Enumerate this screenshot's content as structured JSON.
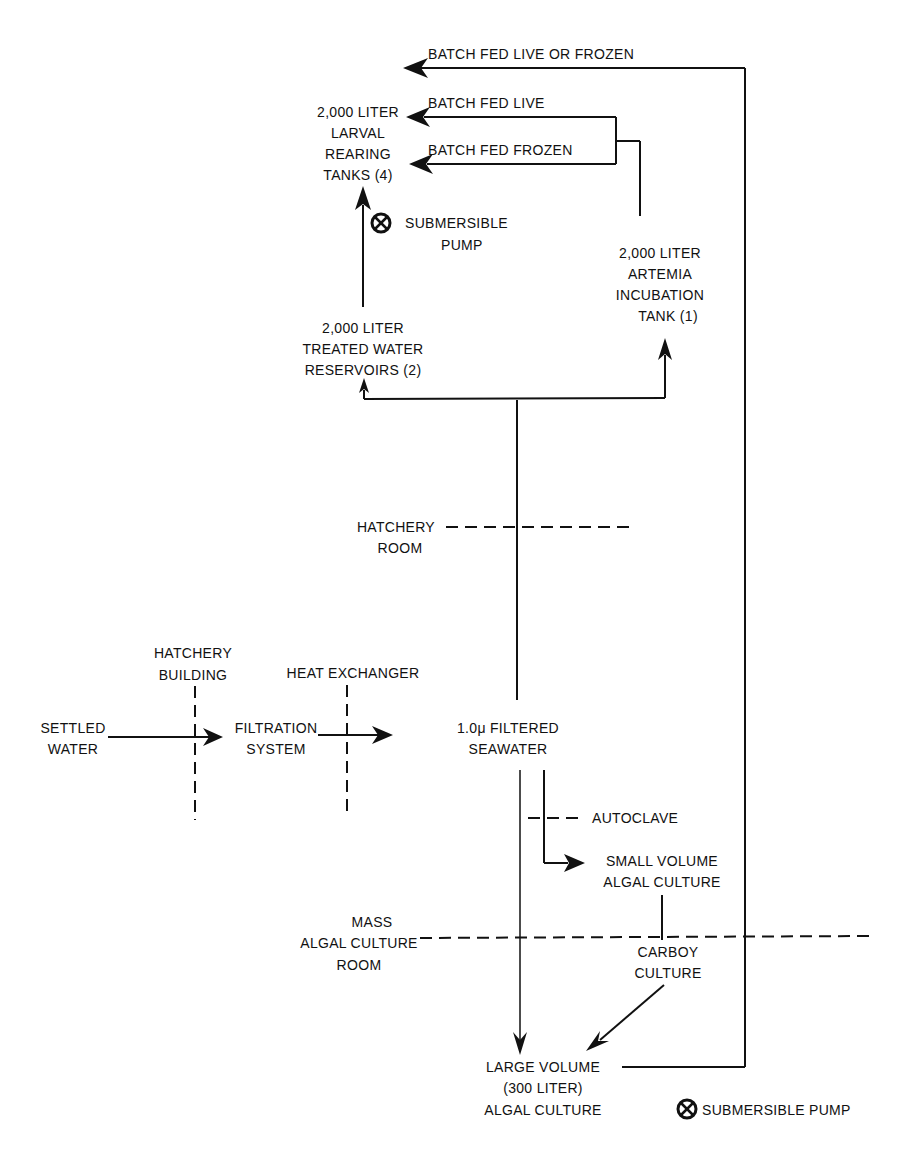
{
  "diagram": {
    "type": "process-flow",
    "nodes": {
      "larval_tanks": [
        "2,000 LITER",
        "LARVAL",
        "REARING",
        "TANKS (4)"
      ],
      "artemia_tank": [
        "2,000 LITER",
        "ARTEMIA",
        "INCUBATION",
        "TANK  (1)"
      ],
      "treated_reservoirs": [
        "2,000 LITER",
        "TREATED WATER",
        "RESERVOIRS (2)"
      ],
      "settled_water": [
        "SETTLED",
        "WATER"
      ],
      "filtration_system": [
        "FILTRATION",
        "SYSTEM"
      ],
      "filtered_seawater": [
        "1.0μ FILTERED",
        "SEAWATER"
      ],
      "small_volume_culture": [
        "SMALL VOLUME",
        "ALGAL CULTURE"
      ],
      "carboy_culture": [
        "CARBOY",
        "CULTURE"
      ],
      "large_volume_culture": [
        "LARGE VOLUME",
        "(300 LITER)",
        "ALGAL CULTURE"
      ]
    },
    "edge_labels": {
      "batch_fed_live_or_frozen": "BATCH FED LIVE OR FROZEN",
      "batch_fed_live": "BATCH FED LIVE",
      "batch_fed_frozen": "BATCH FED FROZEN"
    },
    "boundaries": {
      "hatchery_room": [
        "HATCHERY",
        "ROOM"
      ],
      "hatchery_building": [
        "HATCHERY",
        "BUILDING"
      ],
      "heat_exchanger": "HEAT EXCHANGER",
      "autoclave": "AUTOCLAVE",
      "mass_algal_culture_room": [
        "MASS",
        "ALGAL CULTURE",
        "ROOM"
      ]
    },
    "pumps": {
      "upper_pump": [
        "SUBMERSIBLE",
        "PUMP"
      ],
      "lower_pump": "SUBMERSIBLE PUMP"
    },
    "legend_symbol": "⊗"
  }
}
